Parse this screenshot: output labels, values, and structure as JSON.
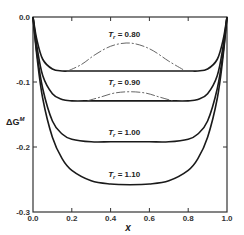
{
  "chart_data": {
    "type": "line",
    "title": "",
    "xlabel": "x",
    "ylabel": "ΔG^M",
    "xlim": [
      0.0,
      1.0
    ],
    "ylim": [
      -0.3,
      0.0
    ],
    "xticks": [
      "0.0",
      "0.2",
      "0.4",
      "0.6",
      "0.8",
      "1.0"
    ],
    "yticks": [
      "0.0",
      "-0.1",
      "-0.2",
      "-0.3"
    ],
    "grid": false,
    "legend": "inline labels above each curve",
    "series": [
      {
        "name": "T_r = 0.80",
        "label": "T",
        "subscript": "r",
        "value_text": " = 0.80",
        "solid_flat_level": -0.083,
        "metastable_hump_peak": -0.04,
        "x": [
          0.0,
          0.02,
          0.05,
          0.1,
          0.15,
          0.2,
          0.3,
          0.4,
          0.5,
          0.6,
          0.7,
          0.8,
          0.85,
          0.9,
          0.95,
          0.98,
          1.0
        ],
        "values": [
          0.0,
          -0.035,
          -0.065,
          -0.08,
          -0.083,
          -0.083,
          -0.083,
          -0.083,
          -0.083,
          -0.083,
          -0.083,
          -0.083,
          -0.083,
          -0.08,
          -0.065,
          -0.035,
          0.0
        ],
        "dashed_x": [
          0.18,
          0.25,
          0.32,
          0.4,
          0.48,
          0.55,
          0.62,
          0.7,
          0.78
        ],
        "dashed_values": [
          -0.083,
          -0.073,
          -0.058,
          -0.045,
          -0.04,
          -0.043,
          -0.052,
          -0.068,
          -0.082
        ]
      },
      {
        "name": "T_r = 0.90",
        "label": "T",
        "subscript": "r",
        "value_text": " = 0.90",
        "solid_flat_level": -0.129,
        "metastable_hump_peak": -0.115,
        "x": [
          0.0,
          0.02,
          0.05,
          0.1,
          0.15,
          0.2,
          0.3,
          0.4,
          0.5,
          0.6,
          0.7,
          0.8,
          0.85,
          0.9,
          0.95,
          0.98,
          1.0
        ],
        "values": [
          0.0,
          -0.045,
          -0.09,
          -0.118,
          -0.127,
          -0.129,
          -0.129,
          -0.129,
          -0.129,
          -0.129,
          -0.129,
          -0.129,
          -0.127,
          -0.118,
          -0.09,
          -0.045,
          0.0
        ],
        "dashed_x": [
          0.28,
          0.35,
          0.42,
          0.5,
          0.58,
          0.65,
          0.72
        ],
        "dashed_values": [
          -0.129,
          -0.123,
          -0.117,
          -0.115,
          -0.117,
          -0.123,
          -0.129
        ]
      },
      {
        "name": "T_r = 1.00",
        "label": "T",
        "subscript": "r",
        "value_text": " = 1.00",
        "x": [
          0.0,
          0.02,
          0.05,
          0.1,
          0.15,
          0.2,
          0.3,
          0.4,
          0.5,
          0.6,
          0.7,
          0.8,
          0.85,
          0.9,
          0.95,
          0.98,
          1.0
        ],
        "values": [
          0.0,
          -0.055,
          -0.11,
          -0.16,
          -0.18,
          -0.188,
          -0.192,
          -0.192,
          -0.192,
          -0.192,
          -0.192,
          -0.188,
          -0.18,
          -0.16,
          -0.11,
          -0.055,
          0.0
        ]
      },
      {
        "name": "T_r = 1.10",
        "label": "T",
        "subscript": "r",
        "value_text": " = 1.10",
        "x": [
          0.0,
          0.02,
          0.05,
          0.1,
          0.15,
          0.2,
          0.3,
          0.4,
          0.5,
          0.6,
          0.7,
          0.8,
          0.85,
          0.9,
          0.95,
          0.98,
          1.0
        ],
        "values": [
          0.0,
          -0.06,
          -0.125,
          -0.185,
          -0.218,
          -0.236,
          -0.252,
          -0.257,
          -0.258,
          -0.257,
          -0.252,
          -0.236,
          -0.218,
          -0.185,
          -0.125,
          -0.06,
          0.0
        ]
      }
    ]
  },
  "axes": {
    "x_title": "x",
    "y_title_main": "ΔG",
    "y_title_sup": "M"
  },
  "colors": {
    "line": "#1a1a1a",
    "dashed": "#555555",
    "axis": "#333333"
  }
}
